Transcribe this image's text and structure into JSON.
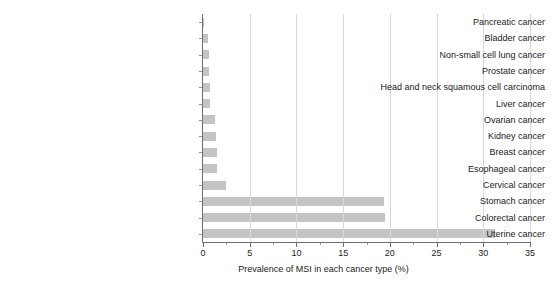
{
  "chart_data": {
    "type": "bar",
    "orientation": "horizontal",
    "title": "",
    "xlabel": "Prevalence of MSI in each cancer type (%)",
    "ylabel": "",
    "xlim": [
      0,
      35
    ],
    "xticks": [
      0,
      5,
      10,
      15,
      20,
      25,
      30,
      35
    ],
    "xtick_labels": [
      "0",
      "5",
      "10",
      "15",
      "20",
      "25",
      "30",
      "35"
    ],
    "minor_xticks": [
      2.5,
      7.5,
      12.5,
      17.5,
      22.5,
      27.5,
      32.5
    ],
    "grid": "vertical-major-only",
    "legend": "none",
    "bar_color": "#c4c4c4",
    "axis_color": "#6e6e6e",
    "grid_color": "#d9d9d9",
    "categories": [
      "Pancreatic cancer",
      "Bladder cancer",
      "Non-small cell lung cancer",
      "Prostate cancer",
      "Head and neck squamous cell carcinoma",
      "Liver cancer",
      "Ovarian cancer",
      "Kidney cancer",
      "Breast cancer",
      "Esophageal cancer",
      "Cervical cancer",
      "Stomach cancer",
      "Colorectal cancer",
      "Uterine cancer"
    ],
    "values": [
      0.1,
      0.5,
      0.6,
      0.6,
      0.8,
      0.8,
      1.3,
      1.4,
      1.5,
      1.5,
      2.5,
      19.4,
      19.5,
      31.3
    ]
  }
}
